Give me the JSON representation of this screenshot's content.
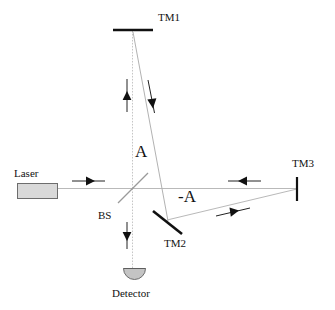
{
  "diagram": {
    "type": "optical-beam-path-diagram",
    "canvas": {
      "width": 335,
      "height": 310,
      "background": "#ffffff"
    },
    "colors": {
      "beam": "#b9b9b9",
      "optic": "#111111",
      "arrow": "#111111",
      "laser_fill": "#d9d9d9",
      "laser_stroke": "#6d6d6d",
      "detector_fill": "#c4c4c4",
      "detector_stroke": "#6d6d6d",
      "text": "#111111"
    },
    "labels": {
      "tm1": "TM1",
      "tm2": "TM2",
      "tm3": "TM3",
      "bs": "BS",
      "laser": "Laser",
      "detector": "Detector",
      "amplitude_positive": "A",
      "amplitude_negative": "-A"
    },
    "components": [
      {
        "name": "laser",
        "label": "Laser",
        "kind": "source-box",
        "x": 17,
        "y": 183,
        "w": 41,
        "h": 16
      },
      {
        "name": "beamsplitter",
        "label": "BS",
        "kind": "diagonal-plate",
        "x1": 118,
        "y1": 202,
        "x2": 147,
        "y2": 173
      },
      {
        "name": "test-mass-1",
        "label": "TM1",
        "kind": "horizontal-mirror-bar",
        "x1": 113,
        "y1": 30,
        "x2": 153,
        "y2": 30
      },
      {
        "name": "test-mass-2",
        "label": "TM2",
        "kind": "diagonal-mirror-bar",
        "x1": 153,
        "y1": 211,
        "x2": 182,
        "y2": 234
      },
      {
        "name": "test-mass-3",
        "label": "TM3",
        "kind": "vertical-mirror-bar",
        "x1": 297,
        "y1": 177,
        "x2": 297,
        "y2": 201
      },
      {
        "name": "detector",
        "label": "Detector",
        "kind": "semicircle-photodiode",
        "cx": 134,
        "cy": 269,
        "r": 11
      }
    ],
    "beams": [
      {
        "name": "laser-to-bs",
        "path": "58,188 132,188"
      },
      {
        "name": "bs-to-tm1",
        "path": "132,188 132,31"
      },
      {
        "name": "tm1-to-tm2",
        "path": "133,32 167,220"
      },
      {
        "name": "tm2-to-tm3",
        "path": "167,220 297,189"
      },
      {
        "name": "bs-to-tm3",
        "path": "132,188 297,188"
      },
      {
        "name": "bs-to-detector",
        "path": "132,188 132,268"
      }
    ],
    "arrows": [
      {
        "name": "arrow-laser-right",
        "direction": "right",
        "x": 72,
        "y": 181,
        "length": 33
      },
      {
        "name": "arrow-vertical-up",
        "direction": "up",
        "x": 127,
        "y": 79,
        "length": 33
      },
      {
        "name": "arrow-slant-down",
        "direction": "down-slanted",
        "x": 152,
        "y": 80,
        "length": 33
      },
      {
        "name": "arrow-horizontal-left",
        "direction": "left",
        "x": 228,
        "y": 181,
        "length": 33
      },
      {
        "name": "arrow-slant-right",
        "direction": "right-slanted",
        "x": 216,
        "y": 213,
        "length": 34
      },
      {
        "name": "arrow-vertical-down",
        "direction": "down",
        "x": 127,
        "y": 222,
        "length": 27
      }
    ]
  }
}
